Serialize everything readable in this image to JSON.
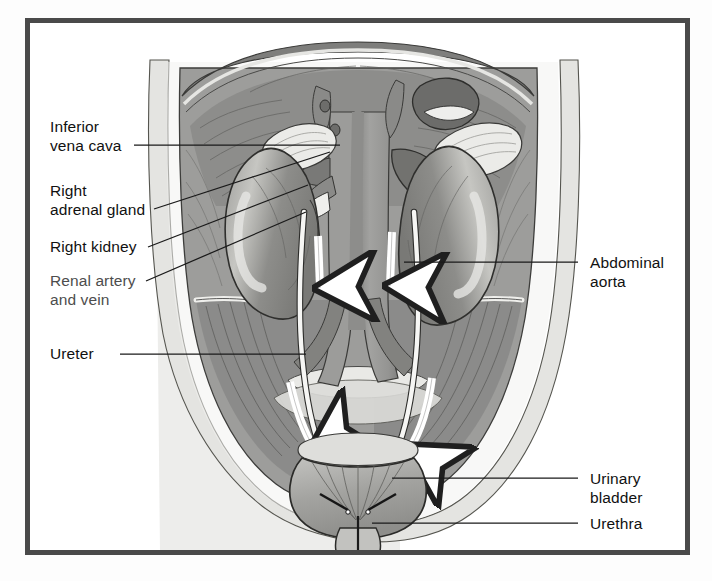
{
  "figure": {
    "kind": "anatomical-illustration",
    "style": "grayscale line-and-tone medical drawing inside a dark rectangular frame",
    "frame_color": "#4a4a4a",
    "background_color": "#ffffff"
  },
  "labels": {
    "inferior_vena_cava": "Inferior\nvena cava",
    "right_adrenal_gland": "Right\nadrenal gland",
    "right_kidney": "Right kidney",
    "renal_artery_and_vein": "Renal artery\nand vein",
    "ureter": "Ureter",
    "abdominal_aorta": "Abdominal\naorta",
    "urinary_bladder": "Urinary\nbladder",
    "urethra": "Urethra"
  },
  "label_list": [
    {
      "id": "inferior-vena-cava",
      "text": "Inferior vena cava",
      "side": "left",
      "degraded": false
    },
    {
      "id": "right-adrenal-gland",
      "text": "Right adrenal gland",
      "side": "left",
      "degraded": false
    },
    {
      "id": "right-kidney",
      "text": "Right kidney",
      "side": "left",
      "degraded": false
    },
    {
      "id": "renal-artery-vein",
      "text": "Renal artery and vein",
      "side": "left",
      "degraded": true
    },
    {
      "id": "ureter",
      "text": "Ureter",
      "side": "left",
      "degraded": false
    },
    {
      "id": "abdominal-aorta",
      "text": "Abdominal aorta",
      "side": "right",
      "degraded": false
    },
    {
      "id": "urinary-bladder",
      "text": "Urinary bladder",
      "side": "right",
      "degraded": false
    },
    {
      "id": "urethra",
      "text": "Urethra",
      "side": "right",
      "degraded": false
    }
  ],
  "palette": {
    "frame": "#4a4a4a",
    "skin_fat": "#e2e2e0",
    "muscle_mid": "#9a9a98",
    "muscle_dark": "#7e7e7c",
    "muscle_shadow": "#6c6c6a",
    "kidney": "#8f8f8d",
    "kidney_highlight": "#c9c9c6",
    "adrenal": "#e8e8e5",
    "vessel_dark": "#6f6f6d",
    "vessel_white": "#f4f4f2",
    "bladder": "#b0b0ad",
    "outline": "#2d2d2d",
    "leader_line": "#1a1a1a",
    "arrow_fill": "#ffffff"
  },
  "annotations": {
    "flow_arrows_count": 4,
    "flow_arrow_meaning": "direction of urine flow down the ureters",
    "arrow_color": "#ffffff"
  }
}
